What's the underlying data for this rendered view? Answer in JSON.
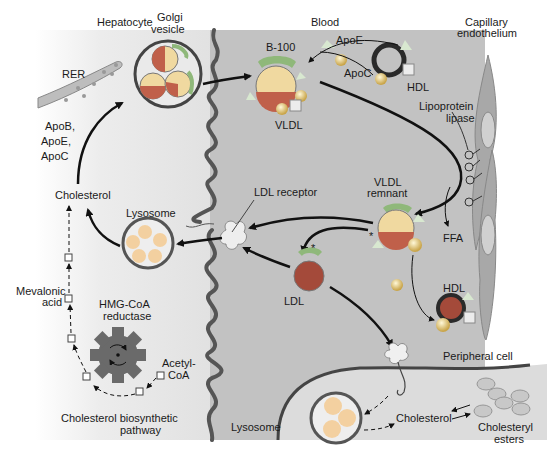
{
  "regions": {
    "hepatocyte": "Hepatocyte",
    "blood": "Blood",
    "capillary_line1": "Capillary",
    "capillary_line2": "endothelium",
    "peripheral_cell": "Peripheral cell"
  },
  "labels": {
    "rer": "RER",
    "golgi_line1": "Golgi",
    "golgi_line2": "vesicle",
    "apob": "ApoB,",
    "apoe_list": "ApoE,",
    "apoc_list": "ApoC",
    "cholesterol_hep": "Cholesterol",
    "lysosome_hep": "Lysosome",
    "mevalonic_line1": "Mevalonic",
    "mevalonic_line2": "acid",
    "hmg_line1": "HMG-CoA",
    "hmg_line2": "reductase",
    "acetyl_line1": "Acetyl-",
    "acetyl_line2": "CoA",
    "biosynth_line1": "Cholesterol biosynthetic",
    "biosynth_line2": "pathway",
    "b100": "B-100",
    "apoe": "ApoE",
    "apoc": "ApoC",
    "hdl_top": "HDL",
    "vldl": "VLDL",
    "lpl_line1": "Lipoprotein",
    "lpl_line2": "lipase",
    "ldl_receptor": "LDL receptor",
    "vldl_remnant_line1": "VLDL",
    "vldl_remnant_line2": "remnant",
    "ffa": "FFA",
    "ldl": "LDL",
    "hdl_bottom": "HDL",
    "asterisk": "*",
    "lysosome_periph": "Lysosome",
    "cholesterol_periph": "Cholesterol",
    "esters_line1": "Cholesteryl",
    "esters_line2": "esters"
  },
  "colors": {
    "hepatocyte_bg": "#e6e6e6",
    "blood_bg": "#bdbdbd",
    "periph_bg": "#d6d6d6",
    "membrane": "#555555",
    "lipid_core": "#f0d9a0",
    "lipid_bottom": "#c0604a",
    "apo_cap": "#8fb87a",
    "ldl_core": "#a44a3a",
    "hdl_ring": "#3a3a3a",
    "gear": "#666666"
  }
}
